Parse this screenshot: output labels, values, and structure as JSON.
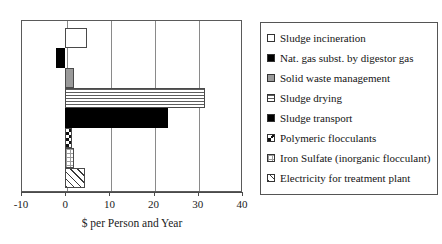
{
  "chart_data": {
    "type": "bar",
    "orientation": "horizontal",
    "title": "",
    "xlabel": "$ per Person and Year",
    "ylabel": "",
    "xlim": [
      -10,
      40
    ],
    "xticks": [
      -10,
      0,
      10,
      20,
      30,
      40
    ],
    "xticklabels": [
      "-10",
      "0",
      "10",
      "20",
      "30",
      "40"
    ],
    "grid": true,
    "legend_position": "right",
    "categories": [
      "Sludge incineration",
      "Nat. gas subst. by digestor gas",
      "Solid waste management",
      "Sludge drying",
      "Sludge transport",
      "Polymeric flocculants",
      "Iron Sulfate (inorganic flocculant)",
      "Electricity for treatment plant"
    ],
    "values": [
      4.9,
      -2.0,
      2.0,
      31.7,
      23.2,
      1.6,
      2.0,
      4.5
    ],
    "patterns": [
      "white",
      "black",
      "gray",
      "horizontal-lines",
      "black",
      "checkerboard",
      "fine-grid",
      "diagonal-hatch"
    ]
  },
  "legend": {
    "items": [
      {
        "label": "Sludge incineration",
        "pattern": "white"
      },
      {
        "label": "Nat. gas subst. by digestor gas",
        "pattern": "black"
      },
      {
        "label": "Solid waste management",
        "pattern": "gray"
      },
      {
        "label": "Sludge drying",
        "pattern": "horizontal-lines"
      },
      {
        "label": "Sludge transport",
        "pattern": "black"
      },
      {
        "label": "Polymeric flocculants",
        "pattern": "checkerboard"
      },
      {
        "label": "Iron Sulfate (inorganic flocculant)",
        "pattern": "fine-grid"
      },
      {
        "label": "Electricity for treatment plant",
        "pattern": "diagonal-hatch"
      }
    ]
  },
  "colors": {
    "frame": "#5a5a5a",
    "gridline": "#8a8a8a",
    "black_fill": "#000000",
    "gray_fill": "#9a9a9a",
    "background": "#ffffff"
  }
}
